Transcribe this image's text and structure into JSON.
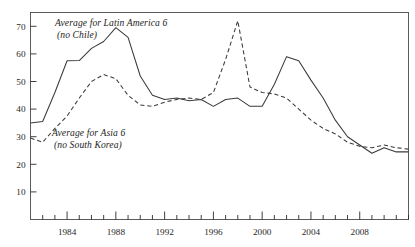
{
  "chart_data": {
    "type": "line",
    "title": "",
    "subtitle": "",
    "xlabel": "",
    "ylabel": "",
    "xlim": [
      1981,
      2012
    ],
    "ylim": [
      0,
      75
    ],
    "yticks": [
      10,
      20,
      30,
      40,
      50,
      60,
      70
    ],
    "xticks": [
      1984,
      1988,
      1992,
      1996,
      2000,
      2004,
      2008
    ],
    "xtick_all_years": [
      1982,
      1983,
      1984,
      1985,
      1986,
      1987,
      1988,
      1989,
      1990,
      1991,
      1992,
      1993,
      1994,
      1995,
      1996,
      1997,
      1998,
      1999,
      2000,
      2001,
      2002,
      2003,
      2004,
      2005,
      2006,
      2007,
      2008,
      2009,
      2010,
      2011,
      2012
    ],
    "grid": false,
    "legend": "inline-annotations",
    "x": [
      1981,
      1982,
      1983,
      1984,
      1985,
      1986,
      1987,
      1988,
      1989,
      1990,
      1991,
      1992,
      1993,
      1994,
      1995,
      1996,
      1997,
      1998,
      1999,
      2000,
      2001,
      2002,
      2003,
      2004,
      2005,
      2006,
      2007,
      2008,
      2009,
      2010,
      2011,
      2012
    ],
    "series": [
      {
        "name": "Average for Latin America 6 (no Chile)",
        "style": "solid",
        "color": "#333333",
        "values": [
          35.0,
          35.5,
          46.0,
          57.5,
          57.6,
          62.0,
          64.5,
          69.5,
          66.0,
          52.0,
          45.0,
          43.5,
          44.0,
          43.0,
          43.5,
          41.0,
          43.5,
          44.0,
          41.0,
          41.0,
          49.0,
          59.0,
          57.5,
          50.5,
          44.0,
          36.0,
          30.0,
          27.0,
          24.0,
          26.0,
          24.5,
          24.5
        ]
      },
      {
        "name": "Average for Asia 6 (no South Korea)",
        "style": "dashed",
        "color": "#333333",
        "values": [
          29.5,
          28.0,
          33.0,
          37.5,
          44.0,
          50.0,
          52.5,
          51.0,
          45.0,
          41.5,
          41.0,
          42.5,
          43.5,
          44.0,
          43.5,
          46.0,
          58.0,
          72.0,
          48.0,
          46.0,
          45.5,
          44.0,
          40.0,
          36.0,
          33.0,
          31.0,
          28.0,
          26.5,
          26.0,
          27.0,
          26.0,
          25.5
        ]
      }
    ],
    "annotations": [
      {
        "id": "latin-america-label",
        "line1": "Average for Latin America 6",
        "line2": "(no Chile)"
      },
      {
        "id": "asia-label",
        "line1": "Average for Asia 6",
        "line2": "(no South Korea)"
      }
    ]
  },
  "axes": {
    "y_tick_labels": [
      "70",
      "60",
      "50",
      "40",
      "30",
      "20",
      "10"
    ],
    "x_tick_labels": [
      "1984",
      "1988",
      "1992",
      "1996",
      "2000",
      "2004",
      "2008"
    ]
  }
}
